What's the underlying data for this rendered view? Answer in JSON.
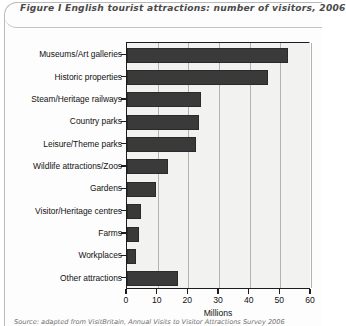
{
  "figure": {
    "title": "Figure I  English tourist attractions: number of visitors, 2006",
    "footnote": "Source: adapted from VisitBritain, Annual Visits to Visitor Attractions Survey 2006"
  },
  "colors": {
    "bar": "#3a3a3a",
    "plot_background": "#f2f2f0",
    "axis": "#1c1c1c",
    "gridline": "#b3b3b3",
    "title_text": "#4a4a4a"
  },
  "chart_data": {
    "type": "bar",
    "orientation": "horizontal",
    "title": "English tourist attractions: number of visitors, 2006",
    "categories": [
      "Museums/Art galleries",
      "Historic properties",
      "Steam/Heritage railways",
      "Country parks",
      "Leisure/Theme parks",
      "Wildlife attractions/Zoos",
      "Gardens",
      "Visitor/Heritage centres",
      "Farms",
      "Workplaces",
      "Other attractions"
    ],
    "values": [
      52.5,
      46,
      24,
      23.5,
      22.5,
      13.5,
      9.5,
      4.5,
      4,
      3,
      16.5
    ],
    "xlabel": "Millions",
    "ylabel": "",
    "xlim": [
      0,
      60
    ],
    "xticks": [
      0,
      10,
      20,
      30,
      40,
      50,
      60
    ],
    "grid": true,
    "legend": "none"
  }
}
